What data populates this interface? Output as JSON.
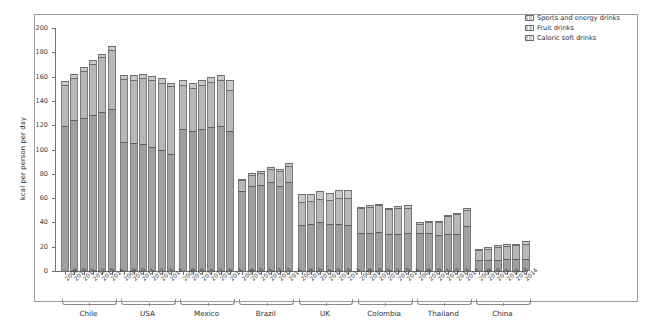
{
  "chart_data": {
    "type": "bar",
    "subtype": "stacked",
    "title": "",
    "xlabel": "",
    "ylabel": "kcal per person per day",
    "ylim": [
      0,
      200
    ],
    "yticks": [
      0,
      20,
      40,
      60,
      80,
      100,
      120,
      140,
      160,
      180,
      200
    ],
    "grid": false,
    "legend_position": "top-right",
    "legend": [
      "Sports and energy drinks",
      "Fruit drinks",
      "Caloric soft drinks"
    ],
    "series": [
      {
        "name": "Caloric soft drinks",
        "values": [
          119,
          124,
          126,
          128,
          131,
          133,
          106,
          105,
          104.5,
          102,
          99.5,
          96,
          117,
          115.5,
          117,
          118.5,
          119.5,
          115,
          65.5,
          70,
          70.5,
          73,
          70,
          73.5,
          38,
          39,
          40,
          39,
          38.5,
          38,
          31,
          31.5,
          32,
          30.5,
          30.5,
          31,
          31,
          31,
          30,
          30.5,
          30.5,
          37,
          9,
          9,
          9,
          9.5,
          9.5,
          10
        ]
      },
      {
        "name": "Fruit drinks",
        "values": [
          34,
          35,
          39,
          42,
          45,
          49,
          52,
          52.5,
          54,
          55,
          55,
          56,
          36,
          35,
          36,
          37,
          38,
          34,
          9,
          9,
          10,
          11,
          12,
          13,
          19,
          18.5,
          19.5,
          19.5,
          21.5,
          22,
          21,
          21.5,
          22,
          20.5,
          21,
          21,
          8,
          9,
          10,
          15,
          16,
          13,
          8,
          9.5,
          10.5,
          11,
          11.5,
          12.5
        ]
      },
      {
        "name": "Sports and energy drinks",
        "values": [
          3,
          3,
          3,
          3.5,
          3,
          3,
          3,
          3.5,
          4,
          3.5,
          4,
          3,
          4,
          4.5,
          4.5,
          4,
          4,
          8,
          1.5,
          1.5,
          1.5,
          2,
          2,
          2.5,
          6,
          6,
          6,
          6,
          6.5,
          7,
          1,
          1,
          1,
          1,
          2,
          2,
          1,
          1,
          1.5,
          1,
          1.5,
          2,
          1.5,
          1.5,
          1.5,
          1.5,
          1.5,
          2
        ]
      }
    ],
    "group_labels": [
      "Chile",
      "USA",
      "Mexico",
      "Brazil",
      "UK",
      "Colombia",
      "Thailand",
      "China"
    ],
    "years": [
      "2009",
      "2010",
      "2011",
      "2012",
      "2013",
      "2014"
    ],
    "totals": [
      156,
      162,
      168,
      173.5,
      179,
      185,
      161,
      161,
      162.5,
      160.5,
      158.5,
      155,
      157,
      155,
      157.5,
      159.5,
      161.5,
      157,
      76,
      80.5,
      82,
      86,
      84,
      89,
      63,
      63.5,
      65.5,
      64.5,
      66.5,
      67,
      53,
      54,
      55,
      52,
      53.5,
      54,
      40,
      41,
      41.5,
      46.5,
      48,
      52,
      18.5,
      20,
      21,
      22,
      22.5,
      24.5
    ],
    "colors": {
      "caloric_soft_drinks": "#a0a0a0",
      "fruit_drinks": "#b8b8b8",
      "sports_and_energy_drinks": "#c9c9c9",
      "axis": "#6f6f6f",
      "frame": "#9a9a9a"
    }
  }
}
